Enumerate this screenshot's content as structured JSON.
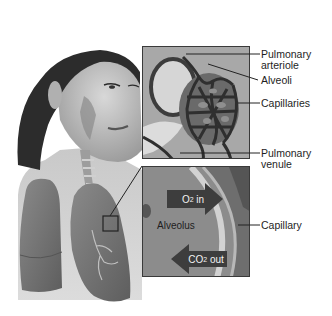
{
  "figure": {
    "colors": {
      "background": "#ffffff",
      "line": "#2a2a2a",
      "arrow_fill": "#3d3d3d",
      "arrow_text": "#f2f2f2"
    }
  },
  "labels": {
    "pulmonary_arteriole": "Pulmonary\narteriole",
    "alveoli": "Alveoli",
    "capillaries": "Capillaries",
    "pulmonary_venule": "Pulmonary\nvenule",
    "capillary": "Capillary",
    "alveolus": "Alveolus"
  },
  "arrows": {
    "o2_in": {
      "prefix": "O",
      "sub": "2",
      "suffix": " in"
    },
    "co2_out": {
      "prefix": "CO",
      "sub": "2",
      "suffix": " out"
    }
  }
}
